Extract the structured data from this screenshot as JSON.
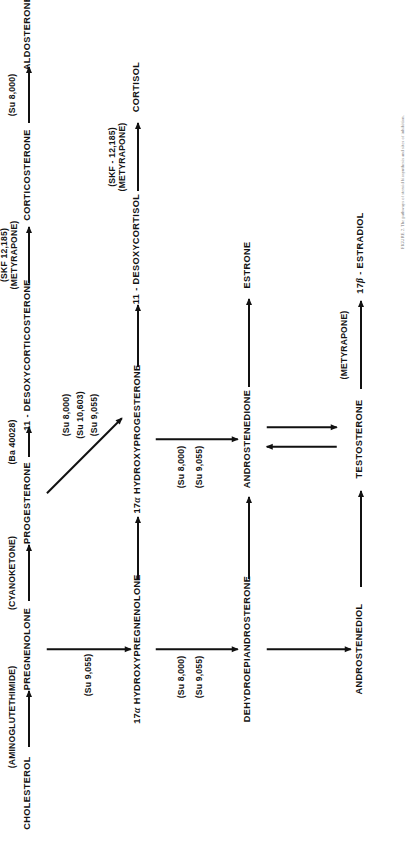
{
  "figure": {
    "orientation": "rotated-90-ccw",
    "caption": "FIGURE 2. The pathways of steroid biosynthesis and sites of inhibition."
  },
  "nodes": {
    "cholesterol": "CHOLESTEROL",
    "pregnenolone": "PREGNENOLONE",
    "progesterone": "PROGESTERONE",
    "desoxycorticosterone": "11 - DESOXYCORTICOSTERONE",
    "corticosterone": "CORTICOSTERONE",
    "aldosterone": "ALDOSTERONE",
    "hydroxypregnenolone_pre": "17",
    "hydroxypregnenolone_alpha": "α",
    "hydroxypregnenolone_post": " HYDROXYPREGNENOLONE",
    "hydroxyprogesterone_pre": "17",
    "hydroxyprogesterone_alpha": "α",
    "hydroxyprogesterone_post": " HYDROXYPROGESTERONE",
    "desoxycortisol": "11 - DESOXYCORTISOL",
    "cortisol": "CORTISOL",
    "dhea": "DEHYDROEPIANDROSTERONE",
    "androstenedione": "ANDROSTENEDIONE",
    "estrone": "ESTRONE",
    "androstenediol": "ANDROSTENEDIOL",
    "testosterone": "TESTOSTERONE",
    "estradiol_pre": "17",
    "estradiol_beta": "β",
    "estradiol_post": " - ESTRADIOL"
  },
  "inhibitors": {
    "aminoglutethimide": "(AMINOGLUTETHIMIDE)",
    "cyanoketone": "(CYANOKETONE)",
    "ba40028": "(Ba 40028)",
    "skf12185_metyrapone_a": "(SKF 12,185)\n(METYRAPONE)",
    "skf12185_line1": "(SKF 12,185)",
    "skf12185_line2": "(METYRAPONE)",
    "skf12185_dot_line1": "(SKF - 12,185)",
    "skf12185_dot_line2": "(METYRAPONE)",
    "su8000": "(Su 8,000)",
    "su9055": "(Su 9,055)",
    "su10603": "(Su 10,603)",
    "metyrapone": "(METYRAPONE)"
  },
  "labels": {
    "su9055_a": "(Su 9,055)",
    "su8000_b": "(Su 8,000)",
    "su9055_b": "(Su 9,055)",
    "su8000_c": "(Su 8,000)",
    "su10603_c": "(Su 10,603)",
    "su9055_c": "(Su 9,055)",
    "su8000_d": "(Su 8,000)",
    "su9055_d": "(Su 9,055)",
    "su8000_e": "(Su 8,000)"
  }
}
